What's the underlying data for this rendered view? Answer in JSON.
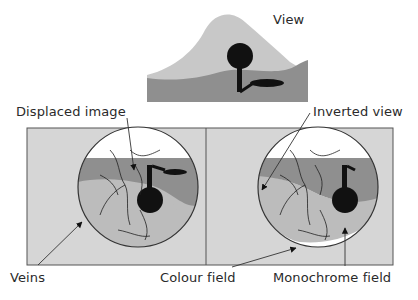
{
  "labels": {
    "view": "View",
    "displaced_image": "Displaced image",
    "inverted_view": "Inverted view",
    "veins": "Veins",
    "colour_field": "Colour field",
    "monochrome_field": "Monochrome field"
  },
  "colors": {
    "sky": "#ffffff",
    "hill_light": "#c8c8c8",
    "ground_dark": "#8f8f8f",
    "panel_bg": "#d6d6d6",
    "tree": "#111111",
    "outline": "#333333"
  }
}
